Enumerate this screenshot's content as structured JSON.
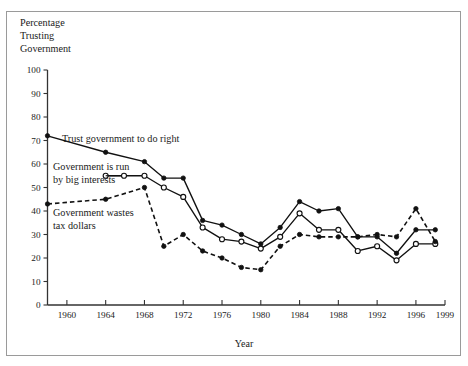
{
  "figure": {
    "background_color": "#ffffff",
    "frame_color": "#9a9a9a",
    "ink_color": "#111111"
  },
  "labels": {
    "y_axis_title_line1": "Percentage",
    "y_axis_title_line2": "Trusting",
    "y_axis_title_line3": "Government",
    "x_axis_title": "Year",
    "annotation_trust": "Trust government to do right",
    "annotation_biginterests_line1": "Government is run",
    "annotation_biginterests_line2": "by big interests",
    "annotation_wastes_line1": "Government wastes",
    "annotation_wastes_line2": "tax dollars"
  },
  "chart_data": {
    "type": "line",
    "title": "",
    "subtitle": "",
    "xlabel": "Year",
    "ylabel": "Percentage Trusting Government",
    "xlim": [
      1958,
      1999
    ],
    "ylim": [
      0,
      100
    ],
    "grid": false,
    "legend_position": "inline-annotations",
    "x_tick_labels": [
      "1960",
      "1964",
      "1968",
      "1972",
      "1976",
      "1980",
      "1984",
      "1988",
      "1992",
      "1996",
      "1999"
    ],
    "x_ticks": [
      1960,
      1964,
      1968,
      1972,
      1976,
      1980,
      1984,
      1988,
      1992,
      1996,
      1999
    ],
    "y_tick_labels": [
      "0",
      "10",
      "20",
      "30",
      "40",
      "50",
      "60",
      "70",
      "80",
      "90",
      "100"
    ],
    "y_ticks": [
      0,
      10,
      20,
      30,
      40,
      50,
      60,
      70,
      80,
      90,
      100
    ],
    "series": [
      {
        "name": "Trust government to do right",
        "marker": "filled-circle",
        "line_style": "solid",
        "x": [
          1958,
          1964,
          1968,
          1970,
          1972,
          1974,
          1976,
          1978,
          1980,
          1982,
          1984,
          1986,
          1988,
          1990,
          1992,
          1994,
          1996,
          1998
        ],
        "values": [
          72,
          65,
          61,
          54,
          54,
          36,
          34,
          30,
          26,
          33,
          44,
          40,
          41,
          29,
          29,
          22,
          32,
          32
        ]
      },
      {
        "name": "Government is run by big interests",
        "marker": "open-circle",
        "line_style": "solid",
        "x": [
          1964,
          1968,
          1970,
          1972,
          1974,
          1976,
          1978,
          1980,
          1982,
          1984,
          1986,
          1988,
          1990,
          1992,
          1994,
          1996,
          1998
        ],
        "values": [
          55,
          55,
          50,
          46,
          33,
          28,
          27,
          24,
          29,
          39,
          32,
          32,
          23,
          25,
          19,
          26,
          26
        ]
      },
      {
        "name": "Government wastes tax dollars",
        "marker": "filled-circle",
        "line_style": "dashed",
        "x": [
          1958,
          1964,
          1968,
          1970,
          1972,
          1974,
          1976,
          1978,
          1980,
          1982,
          1984,
          1986,
          1988,
          1990,
          1992,
          1994,
          1996,
          1998
        ],
        "values": [
          43,
          45,
          50,
          25,
          30,
          23,
          20,
          16,
          15,
          25,
          30,
          29,
          29,
          29,
          30,
          29,
          41,
          27
        ]
      }
    ]
  }
}
